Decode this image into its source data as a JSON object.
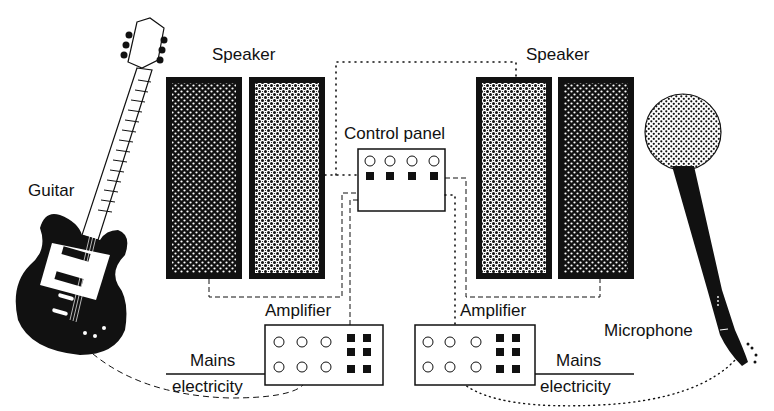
{
  "diagram": {
    "type": "sound-system",
    "labels": {
      "guitar": "Guitar",
      "speaker_left": "Speaker",
      "speaker_right": "Speaker",
      "control_panel": "Control panel",
      "amplifier_left": "Amplifier",
      "amplifier_right": "Amplifier",
      "mains_left_top": "Mains",
      "mains_left_bottom": "electricity",
      "mains_right_top": "Mains",
      "mains_right_bottom": "electricity",
      "microphone": "Microphone"
    },
    "components": [
      {
        "id": "guitar",
        "kind": "input-instrument"
      },
      {
        "id": "microphone",
        "kind": "input-device"
      },
      {
        "id": "speaker_left",
        "kind": "output",
        "cabinets": 2
      },
      {
        "id": "speaker_right",
        "kind": "output",
        "cabinets": 2
      },
      {
        "id": "control_panel",
        "kind": "mixer",
        "knobs": 4,
        "switches": 4
      },
      {
        "id": "amplifier_left",
        "kind": "amplifier",
        "knobs": 6,
        "switches": 6
      },
      {
        "id": "amplifier_right",
        "kind": "amplifier",
        "knobs": 6,
        "switches": 6
      }
    ],
    "connections": [
      {
        "from": "guitar",
        "to": "amplifier_left",
        "style": "dashed"
      },
      {
        "from": "amplifier_left",
        "to": "speaker_left",
        "style": "dashed"
      },
      {
        "from": "amplifier_left",
        "to": "control_panel",
        "style": "dashed"
      },
      {
        "from": "speaker_left",
        "to": "control_panel",
        "style": "dotted"
      },
      {
        "from": "control_panel",
        "to": "speaker_right",
        "style": "dotted"
      },
      {
        "from": "control_panel",
        "to": "amplifier_right",
        "style": "dotted"
      },
      {
        "from": "control_panel",
        "to": "speaker_right",
        "style": "dashed"
      },
      {
        "from": "microphone",
        "to": "amplifier_right",
        "style": "dotted"
      },
      {
        "from": "mains_left",
        "to": "amplifier_left",
        "style": "solid"
      },
      {
        "from": "mains_right",
        "to": "amplifier_right",
        "style": "solid"
      }
    ],
    "colors": {
      "ink": "#111111",
      "background": "#ffffff"
    }
  }
}
